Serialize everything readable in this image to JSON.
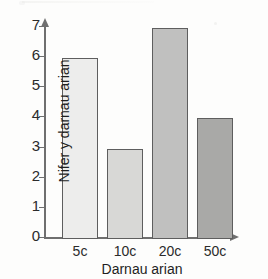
{
  "figure": {
    "background_color": "#fdfdfc",
    "axis_color": "#6f6f6f",
    "bar_border_color": "#5e5e5e"
  },
  "chart_data": {
    "type": "bar",
    "title": "",
    "xlabel": "Darnau arian",
    "ylabel": "Nifer y darnau arian",
    "categories": [
      "5c",
      "10c",
      "20c",
      "50c"
    ],
    "values": [
      6,
      3,
      7,
      4
    ],
    "ylim": [
      0,
      7
    ],
    "yticks": [
      0,
      1,
      2,
      3,
      4,
      5,
      6,
      7
    ],
    "ytick_labels": [
      "0",
      "1",
      "2",
      "3",
      "4",
      "5",
      "6",
      "7"
    ],
    "grid": false,
    "legend": "none",
    "bar_colors": [
      "#ededec",
      "#d8d8d6",
      "#c0c0bf",
      "#a9a9a7"
    ],
    "bar_border_color": "#5e5e5e",
    "axis_arrows": {
      "y": "up-arrow-icon",
      "x": "right-arrow-icon"
    }
  }
}
